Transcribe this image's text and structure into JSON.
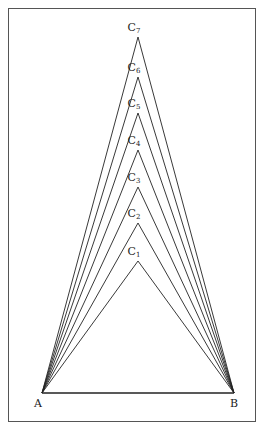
{
  "figure": {
    "base": {
      "A": {
        "label": "A",
        "x": 42,
        "y": 393
      },
      "B": {
        "label": "B",
        "x": 234,
        "y": 393
      }
    },
    "apexes": [
      {
        "label": "C",
        "sub": "1",
        "x": 138,
        "y": 261
      },
      {
        "label": "C",
        "sub": "2",
        "x": 138,
        "y": 223
      },
      {
        "label": "C",
        "sub": "3",
        "x": 138,
        "y": 187
      },
      {
        "label": "C",
        "sub": "4",
        "x": 138,
        "y": 150
      },
      {
        "label": "C",
        "sub": "5",
        "x": 138,
        "y": 113
      },
      {
        "label": "C",
        "sub": "6",
        "x": 138,
        "y": 77
      },
      {
        "label": "C",
        "sub": "7",
        "x": 138,
        "y": 37
      }
    ],
    "line_color": "#222222",
    "border_color": "#555555"
  }
}
